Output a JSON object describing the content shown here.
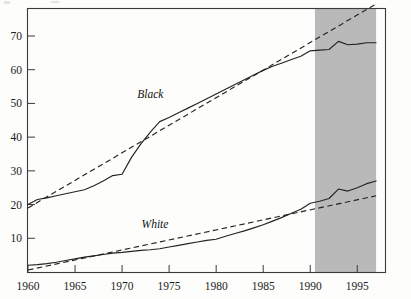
{
  "chart_data": {
    "type": "line",
    "title": "",
    "subtitle": "",
    "xlabel": "",
    "ylabel": "",
    "xlim": [
      1960,
      1998
    ],
    "ylim": [
      0,
      78
    ],
    "grid": false,
    "legend_position": "inline-annotation",
    "x_ticks": [
      "1960",
      "1965",
      "1970",
      "1975",
      "1980",
      "1985",
      "1990",
      "1995"
    ],
    "x_tick_values": [
      1960,
      1965,
      1970,
      1975,
      1980,
      1985,
      1990,
      1995
    ],
    "y_ticks": [
      "10",
      "20",
      "30",
      "40",
      "50",
      "60",
      "70"
    ],
    "y_tick_values": [
      10,
      20,
      30,
      40,
      50,
      60,
      70
    ],
    "annotations": [
      {
        "name": "black-series-label",
        "text": "Black",
        "x": 1973.0,
        "y": 51.5
      },
      {
        "name": "white-series-label",
        "text": "White",
        "x": 1973.5,
        "y": 13.0
      }
    ],
    "shaded_region": {
      "name": "highlight-band",
      "x_start": 1990.5,
      "x_end": 1997.0,
      "color": "#b9b9b9"
    },
    "series": [
      {
        "name": "Black",
        "style": "solid",
        "color": "#232323",
        "x": [
          1960,
          1961,
          1962,
          1963,
          1964,
          1965,
          1966,
          1967,
          1968,
          1969,
          1970,
          1971,
          1972,
          1973,
          1974,
          1975,
          1976,
          1977,
          1978,
          1979,
          1980,
          1981,
          1982,
          1983,
          1984,
          1985,
          1986,
          1987,
          1988,
          1989,
          1990,
          1991,
          1992,
          1993,
          1994,
          1995,
          1996,
          1997
        ],
        "values": [
          20.0,
          21.5,
          22.0,
          22.6,
          23.2,
          23.8,
          24.4,
          25.6,
          27.0,
          28.6,
          29.0,
          34.0,
          38.0,
          41.5,
          44.6,
          45.8,
          47.2,
          48.6,
          50.0,
          51.4,
          52.8,
          54.2,
          55.6,
          57.0,
          58.4,
          59.8,
          61.0,
          62.0,
          63.0,
          64.0,
          65.6,
          65.8,
          66.0,
          68.4,
          67.4,
          67.6,
          68.0,
          68.0
        ]
      },
      {
        "name": "Black trend",
        "style": "dashed",
        "color": "#232323",
        "x": [
          1960,
          1997
        ],
        "values": [
          19.0,
          79.5
        ]
      },
      {
        "name": "White",
        "style": "solid",
        "color": "#232323",
        "x": [
          1960,
          1961,
          1962,
          1963,
          1964,
          1965,
          1966,
          1967,
          1968,
          1969,
          1970,
          1971,
          1972,
          1973,
          1974,
          1975,
          1976,
          1977,
          1978,
          1979,
          1980,
          1981,
          1982,
          1983,
          1984,
          1985,
          1986,
          1987,
          1988,
          1989,
          1990,
          1991,
          1992,
          1993,
          1994,
          1995,
          1996,
          1997
        ],
        "values": [
          2.0,
          2.2,
          2.5,
          2.9,
          3.4,
          3.9,
          4.4,
          4.8,
          5.2,
          5.6,
          5.8,
          6.1,
          6.4,
          6.6,
          6.9,
          7.4,
          7.9,
          8.4,
          8.9,
          9.4,
          9.7,
          10.6,
          11.4,
          12.2,
          13.1,
          14.0,
          15.1,
          16.2,
          17.4,
          18.6,
          20.4,
          21.0,
          21.8,
          24.6,
          24.0,
          25.0,
          26.2,
          27.0
        ]
      },
      {
        "name": "White trend",
        "style": "dashed",
        "color": "#232323",
        "x": [
          1960,
          1997
        ],
        "values": [
          0.6,
          22.6
        ]
      }
    ]
  }
}
